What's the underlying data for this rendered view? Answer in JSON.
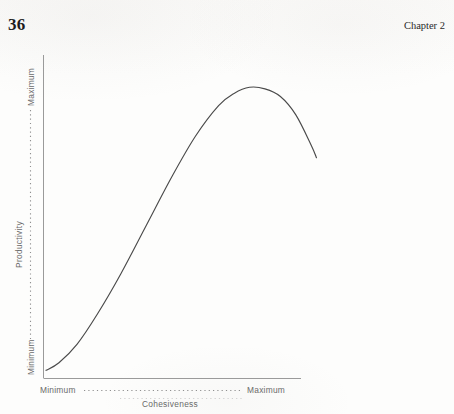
{
  "page": {
    "number": "36",
    "chapter": "Chapter 2",
    "background_color": "#fdfdfc"
  },
  "chart_data": {
    "type": "line",
    "title": "",
    "xlabel": "Cohesiveness",
    "ylabel": "Productivity",
    "x_tick_labels": [
      "Minimum",
      "Maximum"
    ],
    "y_tick_labels": [
      "Minimum",
      "Maximum"
    ],
    "xlim": [
      0,
      1
    ],
    "ylim": [
      0,
      1
    ],
    "grid": false,
    "legend": null,
    "line_color": "#4a4a4a",
    "axis_color": "#9a9a9a",
    "label_color": "#6a6a6a",
    "series": [
      {
        "name": "Productivity vs Cohesiveness",
        "x": [
          0.01,
          0.06,
          0.13,
          0.21,
          0.3,
          0.4,
          0.5,
          0.59,
          0.68,
          0.74,
          0.8,
          0.86,
          0.92,
          0.98,
          1.04,
          1.06
        ],
        "y": [
          0.025,
          0.05,
          0.11,
          0.21,
          0.34,
          0.5,
          0.66,
          0.79,
          0.89,
          0.93,
          0.95,
          0.945,
          0.92,
          0.86,
          0.76,
          0.72
        ]
      }
    ]
  },
  "axis_leaders": {
    "x_leader_style": "dotted",
    "y_leader_style": "dotted"
  }
}
